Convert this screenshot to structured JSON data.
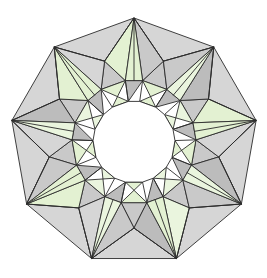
{
  "figure": {
    "background_color": "#ffffff",
    "canvas": {
      "width": 267,
      "height": 278
    },
    "palette": {
      "face_light": "#e3f1d2",
      "face_light_alt": "#eaf5de",
      "face_gray": "#c9c9c9",
      "face_gray_dark": "#bcbcbc",
      "face_gray_light": "#d6d6d6",
      "edge": "#2b2b2b",
      "hole": "#ffffff"
    },
    "geometry": {
      "center": {
        "x": 134,
        "y": 142
      },
      "spike_count": 9,
      "tip_radius": 124,
      "outer_ring_radius": 86,
      "mid_ring_radius": 62,
      "inner_ring_radius": 41,
      "start_angle_deg": -90,
      "tip_angle_offset_deg": 0,
      "outer_angle_offset_deg": 20,
      "inner_twist_deg": 12,
      "hole_radius": 40,
      "stroke_width": 0.9
    },
    "face_color_sequence": [
      "face_light",
      "face_gray",
      "face_light",
      "face_gray_dark",
      "face_light_alt",
      "face_gray",
      "face_light",
      "face_gray_light",
      "face_light"
    ],
    "labels": {
      "alt_text": "Nine-pointed stellated toroidal polyhedron rendered with pale green and gray triangular faces around a circular hole"
    }
  }
}
